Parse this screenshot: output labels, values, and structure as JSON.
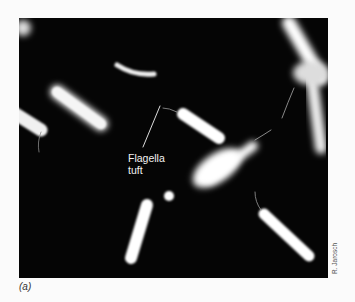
{
  "figure": {
    "panel_label": "(a)",
    "annotation": {
      "line1": "Flagella",
      "line2": "tuft"
    },
    "credit": "R. Jarosch"
  }
}
